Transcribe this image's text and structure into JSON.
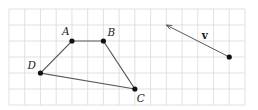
{
  "diagram": {
    "type": "grid-geometry",
    "grid": {
      "x0": 9,
      "y0": 9,
      "cols": 15,
      "rows": 6,
      "cell_w": 15.733,
      "cell_h": 16,
      "line_color": "#d9d9d9"
    },
    "points": [
      {
        "id": "A",
        "label": "A",
        "gx": 4,
        "gy": 2,
        "label_dx": -10,
        "label_dy": -6
      },
      {
        "id": "B",
        "label": "B",
        "gx": 6,
        "gy": 2,
        "label_dx": 4,
        "label_dy": -5
      },
      {
        "id": "C",
        "label": "C",
        "gx": 8,
        "gy": 5,
        "label_dx": 2,
        "label_dy": 13
      },
      {
        "id": "D",
        "label": "D",
        "gx": 2,
        "gy": 4,
        "label_dx": -13,
        "label_dy": -4
      }
    ],
    "polygon": [
      "A",
      "B",
      "C",
      "D"
    ],
    "vector": {
      "label": "v",
      "tail": {
        "gx": 14,
        "gy": 3
      },
      "head": {
        "gx": 10,
        "gy": 1
      },
      "components": [
        -4,
        -2
      ],
      "label_pos": {
        "gx": 12.25,
        "gy": 1.85
      }
    },
    "colors": {
      "edge": "#5a5a5a",
      "point": "#111111",
      "label": "#222222"
    }
  }
}
